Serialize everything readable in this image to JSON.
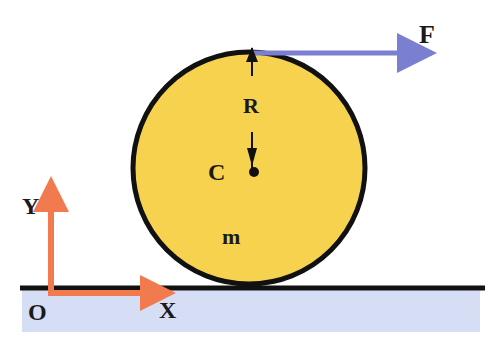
{
  "diagram": {
    "labels": {
      "force": "F",
      "radius": "R",
      "center": "C",
      "mass": "m",
      "y_axis": "Y",
      "x_axis": "X",
      "origin": "O"
    },
    "colors": {
      "cylinder_fill": "#f7d24f",
      "outline": "#111111",
      "force_arrow": "#7b7fd1",
      "axes": "#f27a4f",
      "ground": "#d6def5"
    }
  }
}
